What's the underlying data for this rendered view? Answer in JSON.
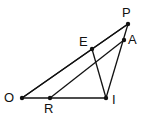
{
  "diagram": {
    "points": [
      {
        "name": "P",
        "label": "P",
        "x": 128,
        "y": 24,
        "lx": 122,
        "ly": 6
      },
      {
        "name": "A",
        "label": "A",
        "x": 124,
        "y": 40,
        "lx": 128,
        "ly": 33
      },
      {
        "name": "E",
        "label": "E",
        "x": 92,
        "y": 49,
        "lx": 79,
        "ly": 35
      },
      {
        "name": "O",
        "label": "O",
        "x": 22,
        "y": 98,
        "lx": 4,
        "ly": 91
      },
      {
        "name": "R",
        "label": "R",
        "x": 50,
        "y": 98,
        "lx": 44,
        "ly": 102
      },
      {
        "name": "I",
        "label": "I",
        "x": 106,
        "y": 98,
        "lx": 112,
        "ly": 93
      }
    ],
    "segments": [
      [
        "O",
        "P"
      ],
      [
        "O",
        "E"
      ],
      [
        "E",
        "P"
      ],
      [
        "R",
        "A"
      ],
      [
        "O",
        "I"
      ],
      [
        "E",
        "I"
      ],
      [
        "P",
        "I"
      ]
    ]
  }
}
